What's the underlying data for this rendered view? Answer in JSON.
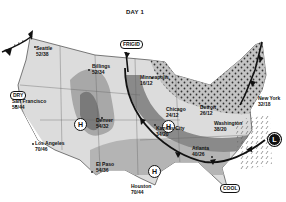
{
  "title": "DAY 1",
  "colors": {
    "background": "#ffffff",
    "land_base": "#dcdcdc",
    "warm_band": "#a8a8a8",
    "dark_band": "#7a7a7a",
    "front": "#111111",
    "cold_zone_dots": "#333333"
  },
  "labels": {
    "dry": "DRY",
    "frigid": "FRIGID",
    "cool": "COOL"
  },
  "pressure_systems": [
    {
      "type": "high",
      "symbol": "H",
      "location": "Nevada/Utah"
    },
    {
      "type": "high",
      "symbol": "H",
      "location": "Minnesota/Iowa"
    },
    {
      "type": "high",
      "symbol": "H",
      "location": "Texas"
    },
    {
      "type": "low",
      "symbol": "L",
      "location": "Atlantic off Carolinas"
    }
  ],
  "cities": [
    {
      "name": "Seattle",
      "temps": "52/38"
    },
    {
      "name": "Billings",
      "temps": "52/34"
    },
    {
      "name": "Minneapolis",
      "temps": "16/12"
    },
    {
      "name": "San Francisco",
      "temps": "58/44"
    },
    {
      "name": "Denver",
      "temps": "54/32"
    },
    {
      "name": "Chicago",
      "temps": "24/12"
    },
    {
      "name": "Detroit",
      "temps": "26/12"
    },
    {
      "name": "New York",
      "temps": "32/18"
    },
    {
      "name": "Kansas City",
      "temps": "34/20"
    },
    {
      "name": "Washington",
      "temps": "38/20"
    },
    {
      "name": "Los Angeles",
      "temps": "70/46"
    },
    {
      "name": "El Paso",
      "temps": "54/36"
    },
    {
      "name": "Atlanta",
      "temps": "40/26"
    },
    {
      "name": "Houston",
      "temps": "70/44"
    }
  ]
}
